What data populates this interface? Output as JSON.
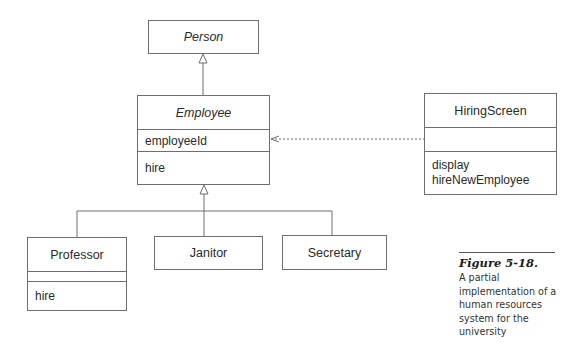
{
  "diagram": {
    "type": "UML class diagram",
    "classes": {
      "person": {
        "name": "Person",
        "abstract": true
      },
      "employee": {
        "name": "Employee",
        "abstract": true,
        "attributes": [
          "employeeId"
        ],
        "operations": [
          "hire"
        ]
      },
      "hiring_screen": {
        "name": "HiringScreen",
        "attributes": [],
        "operations": [
          "display",
          "hireNewEmployee"
        ]
      },
      "professor": {
        "name": "Professor",
        "attributes": [],
        "operations": [
          "hire"
        ]
      },
      "janitor": {
        "name": "Janitor"
      },
      "secretary": {
        "name": "Secretary"
      }
    },
    "relationships": [
      {
        "type": "generalization",
        "from": "Employee",
        "to": "Person"
      },
      {
        "type": "generalization",
        "from": "Professor",
        "to": "Employee"
      },
      {
        "type": "generalization",
        "from": "Janitor",
        "to": "Employee"
      },
      {
        "type": "generalization",
        "from": "Secretary",
        "to": "Employee"
      },
      {
        "type": "dependency",
        "from": "HiringScreen",
        "to": "Employee"
      }
    ],
    "line_color": "#6e6e6e"
  },
  "caption": {
    "title": "Figure 5-18.",
    "body": "A partial implementation of a human resources system for the university"
  }
}
